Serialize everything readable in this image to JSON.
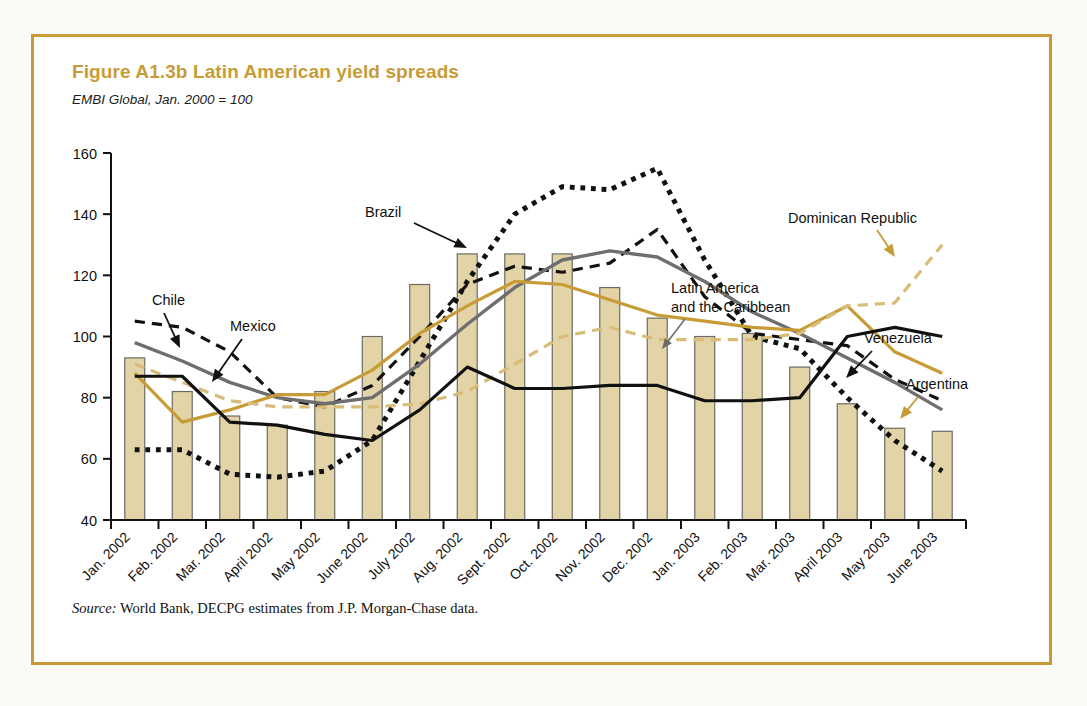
{
  "figure": {
    "number": "Figure A1.3b",
    "title": "Latin American yield spreads",
    "full_title": "Figure A1.3b  Latin American yield spreads",
    "subtitle": "EMBI Global, Jan. 2000 = 100",
    "source_label": "Source:",
    "source_text": "World Bank, DECPG estimates from J.P. Morgan-Chase data.",
    "border_color": "#c79c36",
    "title_color": "#c79c36"
  },
  "chart_data": {
    "type": "line",
    "title": "Figure A1.3b  Latin American yield spreads",
    "subtitle": "EMBI Global, Jan. 2000 = 100",
    "xlabel": "",
    "ylabel": "",
    "ylim": [
      40,
      160
    ],
    "yticks": [
      40,
      60,
      80,
      100,
      120,
      140,
      160
    ],
    "ytick_labels": [
      "40",
      "60",
      "80",
      "100",
      "120",
      "140",
      "160"
    ],
    "grid": false,
    "legend": "annotations",
    "categories": [
      "Jan. 2002",
      "Feb. 2002",
      "Mar. 2002",
      "April 2002",
      "May 2002",
      "June 2002",
      "July 2002",
      "Aug. 2002",
      "Sept. 2002",
      "Oct. 2002",
      "Nov. 2002",
      "Dec. 2002",
      "Jan. 2003",
      "Feb. 2003",
      "Mar. 2003",
      "April 2003",
      "May 2003",
      "June 2003"
    ],
    "series": [
      {
        "name": "Latin America and the Caribbean",
        "style": "bar",
        "color": "#e3d4a8",
        "edge_color": "#6b6b63",
        "values": [
          93,
          82,
          74,
          71,
          82,
          100,
          117,
          127,
          127,
          127,
          116,
          106,
          100,
          101,
          90,
          78,
          70,
          69
        ]
      },
      {
        "name": "Brazil",
        "style": "dotted",
        "color": "#111111",
        "values": [
          63,
          63,
          55,
          54,
          56,
          66,
          92,
          118,
          140,
          149,
          148,
          155,
          125,
          100,
          96,
          80,
          66,
          56
        ]
      },
      {
        "name": "Chile",
        "style": "dashed",
        "color": "#111111",
        "values": [
          105,
          103,
          95,
          80,
          77,
          84,
          100,
          117,
          123,
          121,
          124,
          135,
          113,
          101,
          99,
          97,
          86,
          79
        ]
      },
      {
        "name": "Mexico",
        "style": "solid",
        "color": "#6e6e6e",
        "values": [
          98,
          92,
          85,
          80,
          78,
          80,
          91,
          104,
          116,
          125,
          128,
          126,
          118,
          108,
          101,
          93,
          85,
          76
        ]
      },
      {
        "name": "Argentina",
        "style": "solid",
        "color": "#c79c36",
        "values": [
          88,
          72,
          76,
          81,
          81,
          89,
          101,
          110,
          118,
          117,
          112,
          107,
          105,
          103,
          102,
          110,
          95,
          88
        ]
      },
      {
        "name": "Dominican Republic",
        "style": "dashed",
        "color": "#d8bc77",
        "values": [
          91,
          85,
          79,
          77,
          77,
          77,
          78,
          82,
          91,
          100,
          103,
          99,
          99,
          99,
          101,
          110,
          111,
          130
        ]
      },
      {
        "name": "Venezuela",
        "style": "solid",
        "color": "#111111",
        "values": [
          87,
          87,
          72,
          71,
          68,
          66,
          76,
          90,
          83,
          83,
          84,
          84,
          79,
          79,
          80,
          100,
          103,
          100
        ]
      }
    ],
    "annotations": [
      {
        "label": "Chile",
        "target_series": "Chile"
      },
      {
        "label": "Mexico",
        "target_series": "Mexico"
      },
      {
        "label": "Brazil",
        "target_series": "Brazil"
      },
      {
        "label": "Latin America\nand the Caribbean",
        "line1": "Latin America",
        "line2": "and the Caribbean",
        "target_series": "Latin America and the Caribbean"
      },
      {
        "label": "Dominican Republic",
        "target_series": "Dominican Republic"
      },
      {
        "label": "Venezuela",
        "target_series": "Venezuela"
      },
      {
        "label": "Argentina",
        "target_series": "Argentina"
      }
    ]
  },
  "annotations_text": {
    "chile": "Chile",
    "mexico": "Mexico",
    "brazil": "Brazil",
    "lac_line1": "Latin America",
    "lac_line2": "and the Caribbean",
    "dominican_republic": "Dominican Republic",
    "venezuela": "Venezuela",
    "argentina": "Argentina"
  },
  "axis": {
    "y_labels": [
      "160",
      "140",
      "120",
      "100",
      "80",
      "60",
      "40"
    ],
    "x_labels": [
      "Jan. 2002",
      "Feb. 2002",
      "Mar. 2002",
      "April 2002",
      "May 2002",
      "June 2002",
      "July 2002",
      "Aug. 2002",
      "Sept. 2002",
      "Oct. 2002",
      "Nov. 2002",
      "Dec. 2002",
      "Jan. 2003",
      "Feb. 2003",
      "Mar. 2003",
      "April 2003",
      "May 2003",
      "June 2003"
    ]
  }
}
